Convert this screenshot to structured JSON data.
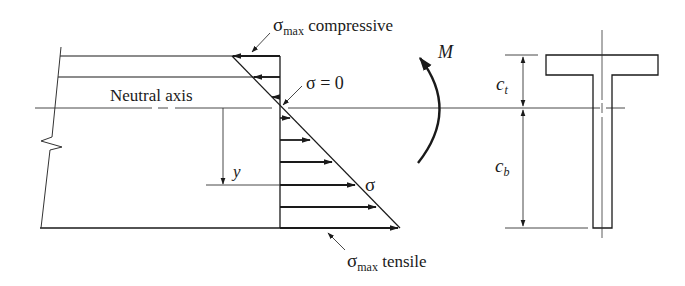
{
  "figure": {
    "labels": {
      "sigma_max_compressive_symbol": "σ",
      "sigma_max_compressive_sub": "max",
      "sigma_max_compressive_text": " compressive",
      "sigma_zero": "σ = 0",
      "neutral_axis": "Neutral axis",
      "moment": "M",
      "y": "y",
      "sigma": "σ",
      "sigma_max_tensile_symbol": "σ",
      "sigma_max_tensile_sub": "max",
      "sigma_max_tensile_text": " tensile",
      "c_top_symbol": "c",
      "c_top_sub": "t",
      "c_bottom_symbol": "c",
      "c_bottom_sub": "b"
    },
    "colors": {
      "line": "#1a1a1a",
      "thin_line": "#333333",
      "background": "#ffffff"
    }
  }
}
